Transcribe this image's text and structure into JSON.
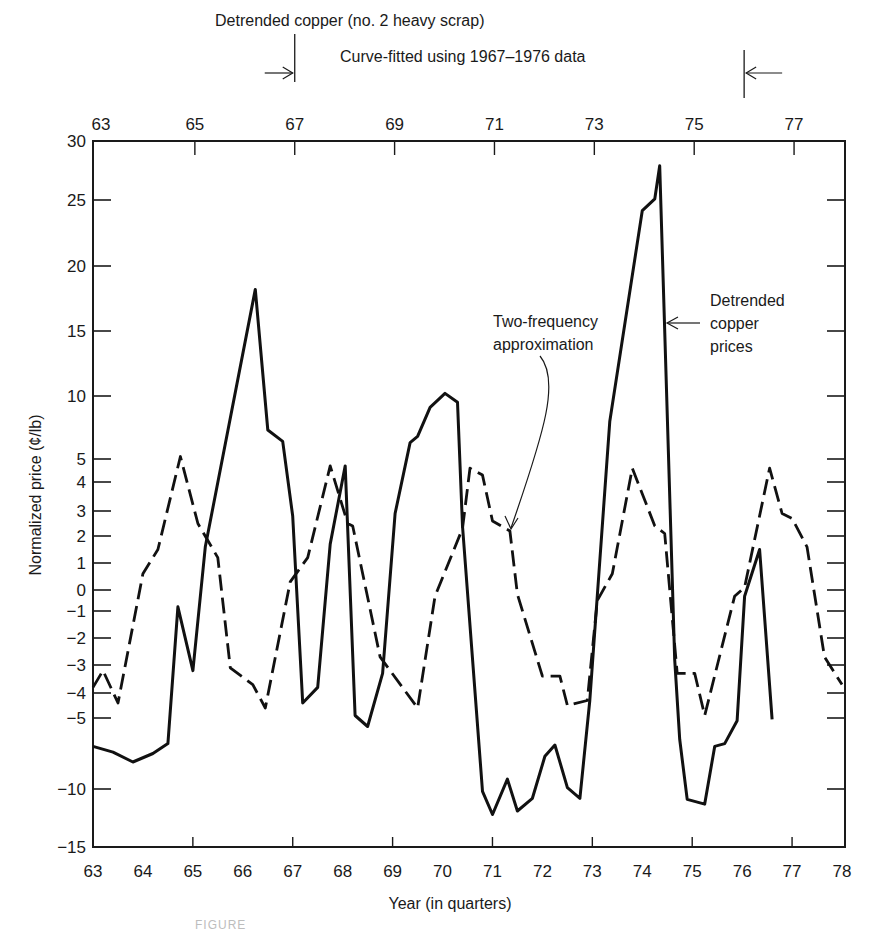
{
  "header": {
    "title": "Detrended copper (no. 2 heavy scrap)",
    "fit_range_label": "Curve-fitted using 1967–1976 data",
    "fit_range_start": 67,
    "fit_range_end": 76
  },
  "annotations": {
    "two_frequency": [
      "Two-frequency",
      "approximation"
    ],
    "detrended": [
      "Detrended",
      "copper",
      "prices"
    ]
  },
  "caption": "FIGURE",
  "chart_data": {
    "type": "line",
    "title": "Detrended copper (no. 2 heavy scrap)",
    "subtitle": "Curve-fitted using 1967–1976 data",
    "xlabel": "Year (in quarters)",
    "ylabel": "Normalized price (¢/lb)",
    "xlim": [
      63,
      78
    ],
    "ylim": [
      -15,
      30
    ],
    "x_ticks_bottom": [
      63,
      64,
      65,
      66,
      67,
      68,
      69,
      70,
      71,
      72,
      73,
      74,
      75,
      76,
      77,
      78
    ],
    "x_ticks_top": [
      63,
      65,
      67,
      69,
      71,
      73,
      75,
      77
    ],
    "y_ticks": [
      30,
      25,
      20,
      15,
      10,
      5,
      4,
      3,
      2,
      1,
      0,
      -1,
      -2,
      -3,
      -4,
      -5,
      -10,
      -15
    ],
    "y_tick_labels": [
      "30",
      "25",
      "20",
      "15",
      "10",
      "5",
      "4",
      "3",
      "2",
      "1",
      "0",
      "−1",
      "−2",
      "−3",
      "−4",
      "−5",
      "−10",
      "−15"
    ],
    "y_scale_note": "non-linear axis: expanded between -5 and 5",
    "grid": false,
    "series": [
      {
        "name": "Detrended copper prices",
        "style": "solid",
        "x": [
          63.0,
          63.4,
          63.8,
          64.2,
          64.5,
          64.7,
          65.0,
          65.25,
          66.25,
          66.5,
          66.8,
          67.0,
          67.2,
          67.5,
          67.75,
          68.05,
          68.25,
          68.5,
          68.8,
          69.05,
          69.35,
          69.5,
          69.75,
          70.05,
          70.3,
          70.4,
          70.8,
          71.0,
          71.3,
          71.5,
          71.8,
          72.05,
          72.25,
          72.5,
          72.75,
          72.95,
          73.35,
          74.0,
          74.25,
          74.35,
          74.65,
          74.75,
          74.9,
          75.25,
          75.45,
          75.65,
          75.9,
          76.05,
          76.35,
          76.6
        ],
        "values": [
          -7.0,
          -7.4,
          -8.1,
          -7.5,
          -6.8,
          -0.8,
          -3.2,
          1.6,
          18.2,
          7.3,
          6.4,
          2.8,
          -4.4,
          -3.8,
          1.7,
          4.7,
          -4.9,
          -5.6,
          -3.3,
          2.9,
          6.3,
          6.8,
          9.1,
          10.2,
          9.5,
          2.4,
          -10.2,
          -12.2,
          -9.3,
          -11.9,
          -10.8,
          -7.7,
          -6.9,
          -9.9,
          -10.8,
          -4.3,
          8.0,
          24.2,
          25.1,
          27.9,
          -2.8,
          -6.5,
          -10.9,
          -11.3,
          -7.0,
          -6.8,
          -5.2,
          -0.3,
          1.5,
          -5.1
        ]
      },
      {
        "name": "Two-frequency approximation",
        "style": "dashed",
        "x": [
          63.0,
          63.2,
          63.5,
          64.0,
          64.3,
          64.75,
          65.1,
          65.5,
          65.75,
          66.2,
          66.45,
          66.95,
          67.3,
          67.75,
          68.1,
          68.2,
          68.75,
          69.5,
          69.85,
          70.4,
          70.55,
          70.8,
          71.0,
          71.35,
          71.5,
          72.0,
          72.35,
          72.5,
          72.9,
          73.1,
          73.4,
          73.8,
          74.25,
          74.45,
          74.7,
          75.05,
          75.25,
          75.85,
          76.05,
          76.55,
          76.8,
          77.0,
          77.3,
          77.65,
          78.0
        ],
        "values": [
          -3.8,
          -3.2,
          -4.4,
          0.6,
          1.5,
          5.2,
          2.5,
          1.2,
          -3.1,
          -3.7,
          -4.6,
          0.3,
          1.2,
          4.7,
          2.5,
          2.4,
          -2.7,
          -4.6,
          -0.3,
          2.3,
          4.6,
          4.3,
          2.6,
          2.2,
          -0.2,
          -3.4,
          -3.4,
          -4.5,
          -4.3,
          -0.5,
          0.6,
          4.6,
          2.4,
          2.1,
          -3.3,
          -3.3,
          -4.9,
          -0.3,
          0.1,
          4.6,
          2.9,
          2.7,
          1.6,
          -2.7,
          -3.7
        ]
      }
    ]
  }
}
